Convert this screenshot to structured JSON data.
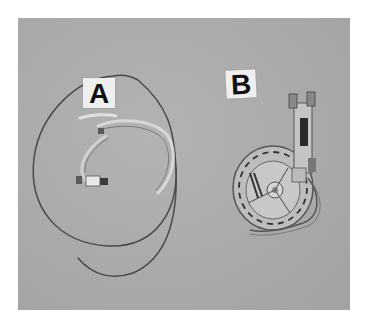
{
  "image": {
    "description": "Grayscale photograph of two medical devices on a grey background",
    "colors": {
      "background": "#ffffff",
      "photo_bg": "#aaaaaa",
      "label_card": "#efefef",
      "label_text": "#111111",
      "tubing": "#4a4a4a"
    }
  },
  "labels": {
    "a": "A",
    "b": "B"
  },
  "objects": [
    {
      "id": "A",
      "kind": "coiled tubing / catheter set with connectors"
    },
    {
      "id": "B",
      "kind": "circular cassette / pump device with tubing"
    }
  ]
}
